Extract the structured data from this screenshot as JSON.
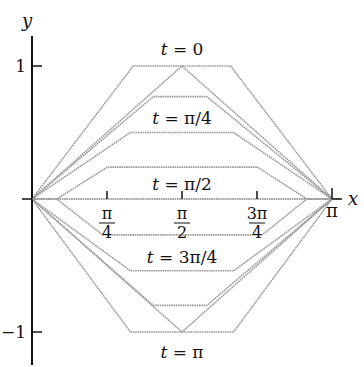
{
  "chart_data": {
    "type": "line",
    "title": "",
    "xlabel": "x",
    "ylabel": "y",
    "xlim": [
      0,
      3.14159
    ],
    "ylim": [
      -1,
      1
    ],
    "grid": false,
    "legend": "none",
    "x_ticks": [
      {
        "value": 0.7854,
        "label_num": "π",
        "label_den": "4"
      },
      {
        "value": 1.5708,
        "label_num": "π",
        "label_den": "2"
      },
      {
        "value": 2.3562,
        "label_num": "3π",
        "label_den": "4"
      },
      {
        "value": 3.14159,
        "label": "π"
      }
    ],
    "y_ticks": [
      {
        "value": 1,
        "label": "1"
      },
      {
        "value": -1,
        "label": "−1"
      }
    ],
    "annotations": [
      {
        "text": "t = 0",
        "x": 1.5708,
        "y": 1.12
      },
      {
        "text": "t = π/4",
        "x": 1.5708,
        "y": 0.62
      },
      {
        "text": "t = π/2",
        "x": 1.5708,
        "y": 0.1
      },
      {
        "text": "t = 3π/4",
        "x": 1.5708,
        "y": -0.56
      },
      {
        "text": "t = π",
        "x": 1.5708,
        "y": -1.13
      }
    ],
    "series": [
      {
        "name": "upper trapezoid y=1",
        "points": [
          [
            0,
            0
          ],
          [
            1.06,
            1.0
          ],
          [
            2.08,
            1.0
          ],
          [
            3.14159,
            0
          ]
        ]
      },
      {
        "name": "t = 0 triangle",
        "points": [
          [
            0,
            0
          ],
          [
            1.5708,
            1.0
          ],
          [
            3.14159,
            0
          ]
        ]
      },
      {
        "name": "upper y=0.77",
        "points": [
          [
            0,
            0
          ],
          [
            1.27,
            0.77
          ],
          [
            1.83,
            0.77
          ],
          [
            3.14159,
            0
          ]
        ]
      },
      {
        "name": "upper y=0.5",
        "points": [
          [
            0,
            0
          ],
          [
            1.03,
            0.5
          ],
          [
            2.11,
            0.5
          ],
          [
            3.14159,
            0
          ]
        ]
      },
      {
        "name": "upper y=0.24",
        "points": [
          [
            0,
            0
          ],
          [
            0.26,
            0
          ],
          [
            0.79,
            0.24
          ],
          [
            2.36,
            0.24
          ],
          [
            2.88,
            0
          ],
          [
            3.14159,
            0
          ]
        ]
      },
      {
        "name": "t = π/2 (axis)",
        "points": [
          [
            0,
            0
          ],
          [
            3.14159,
            0
          ]
        ]
      },
      {
        "name": "lower y=-0.27",
        "points": [
          [
            0,
            0
          ],
          [
            0.26,
            0
          ],
          [
            0.74,
            -0.27
          ],
          [
            2.41,
            -0.27
          ],
          [
            2.88,
            0
          ],
          [
            3.14159,
            0
          ]
        ]
      },
      {
        "name": "lower y=-0.54",
        "points": [
          [
            0,
            0
          ],
          [
            1.03,
            -0.54
          ],
          [
            2.11,
            -0.54
          ],
          [
            3.14159,
            0
          ]
        ]
      },
      {
        "name": "lower y=-0.8",
        "points": [
          [
            0,
            0
          ],
          [
            1.27,
            -0.8
          ],
          [
            1.83,
            -0.8
          ],
          [
            3.14159,
            0
          ]
        ]
      },
      {
        "name": "t = π triangle",
        "points": [
          [
            0,
            0
          ],
          [
            1.5708,
            -1.0
          ],
          [
            3.14159,
            0
          ]
        ]
      },
      {
        "name": "lower trapezoid y=-1",
        "points": [
          [
            0,
            0
          ],
          [
            1.03,
            -1.0
          ],
          [
            2.11,
            -1.0
          ],
          [
            3.14159,
            0
          ]
        ]
      }
    ]
  },
  "px": {
    "ox": 32,
    "oy": 199,
    "xscale": 95.5,
    "yscale": 133
  }
}
